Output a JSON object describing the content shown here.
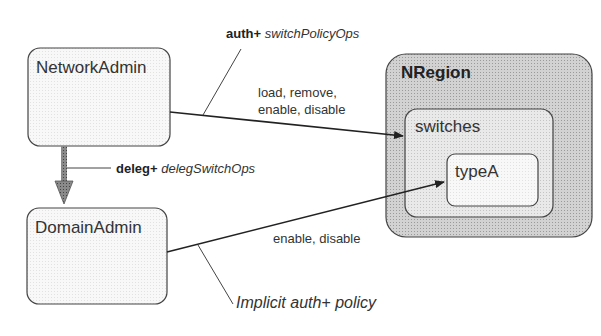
{
  "nodes": {
    "network_admin": {
      "label": "NetworkAdmin"
    },
    "domain_admin": {
      "label": "DomainAdmin"
    },
    "nregion": {
      "label": "NRegion"
    },
    "switches": {
      "label": "switches"
    },
    "type_a": {
      "label": "typeA"
    }
  },
  "edges": {
    "auth_policy": {
      "keyword": "auth+",
      "name": "switchPolicyOps"
    },
    "network_ops": {
      "line1": "load, remove,",
      "line2": "enable, disable"
    },
    "deleg_policy": {
      "keyword": "deleg+",
      "name": "delegSwitchOps"
    },
    "domain_ops": {
      "label": "enable, disable"
    },
    "implicit_policy": {
      "label": "Implicit auth+ policy"
    }
  },
  "colors": {
    "stroke": "#333333",
    "nregion_fill": "#c8c8c8",
    "switches_fill": "#e2e2e2",
    "typea_fill": "#efefef",
    "admin_fill": "#f7f7f7"
  }
}
